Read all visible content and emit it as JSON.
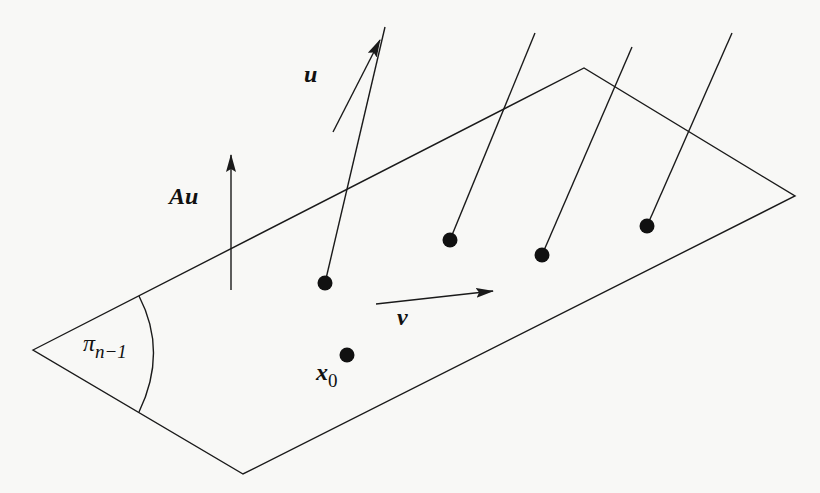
{
  "diagram": {
    "type": "geometric-figure",
    "stroke_color": "#1a1a1a",
    "background": "#f8f8f6",
    "plane": {
      "label_base": "π",
      "label_subscript": "n−1",
      "vertices": [
        [
          33,
          350
        ],
        [
          584,
          68
        ],
        [
          795,
          196
        ],
        [
          243,
          474
        ]
      ]
    },
    "points": [
      {
        "id": "p1",
        "x": 325,
        "y": 283,
        "line_to": [
          385,
          27
        ]
      },
      {
        "id": "p2",
        "x": 450,
        "y": 240,
        "line_to": [
          535,
          33
        ]
      },
      {
        "id": "p3",
        "x": 542,
        "y": 255,
        "line_to": [
          632,
          47
        ]
      },
      {
        "id": "p4",
        "x": 647,
        "y": 226,
        "line_to": [
          732,
          33
        ]
      },
      {
        "id": "x0",
        "x": 347,
        "y": 355,
        "label_base": "x",
        "label_subscript": "0"
      }
    ],
    "vectors": [
      {
        "id": "u",
        "label": "u",
        "from": [
          333,
          132
        ],
        "to": [
          380,
          40
        ]
      },
      {
        "id": "Au",
        "label": "Au",
        "from": [
          231,
          290
        ],
        "to": [
          231,
          155
        ]
      },
      {
        "id": "v",
        "label": "v",
        "from": [
          376,
          304
        ],
        "to": [
          493,
          291
        ]
      }
    ]
  }
}
